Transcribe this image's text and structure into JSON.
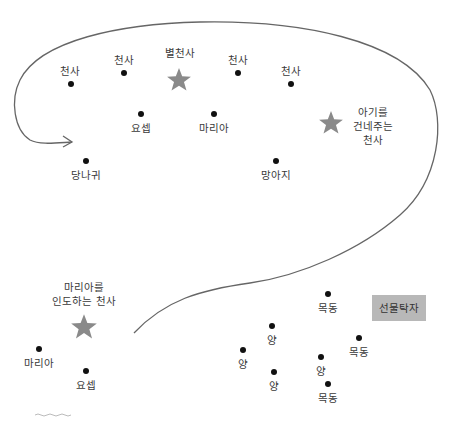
{
  "diagram": {
    "colors": {
      "dot": "#111111",
      "star": "#8a8a8a",
      "curve": "#666666",
      "gift_box_bg": "#b8b8b8",
      "text": "#3a3a3a"
    },
    "top_group": {
      "angel_1": "천사",
      "angel_2": "천사",
      "star_angel": "별천사",
      "angel_3": "천사",
      "angel_4": "천사",
      "joseph": "요셉",
      "mary": "마리아",
      "baby_giving_angel": "아기를\n건네주는\n천사",
      "donkey": "당나귀",
      "calf": "망아지"
    },
    "bottom_group": {
      "mary_guiding_angel": "마리아를\n인도하는 천사",
      "mary": "마리아",
      "joseph": "요셉",
      "shepherd_1": "목동",
      "shepherd_2": "목동",
      "shepherd_3": "목동",
      "sheep_1": "양",
      "sheep_2": "양",
      "sheep_3": "양",
      "sheep_4": "양",
      "gift_box": "선물탁자"
    }
  }
}
